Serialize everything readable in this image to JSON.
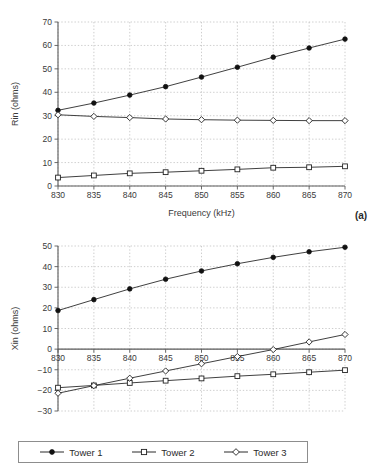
{
  "figure": {
    "background": "#ffffff",
    "line_color": "#2a2a2a",
    "grid_color": "#b9b9b9",
    "axis_color": "#5a5a5a"
  },
  "legend": {
    "position": "bottom",
    "border_color": "#8d8d8d",
    "entries": [
      {
        "label": "Tower 1",
        "marker": "filled-circle",
        "marker_icon": "filled-circle-icon"
      },
      {
        "label": "Tower 2",
        "marker": "open-square",
        "marker_icon": "open-square-icon"
      },
      {
        "label": "Tower 3",
        "marker": "open-diamond",
        "marker_icon": "open-diamond-icon"
      }
    ]
  },
  "chart_data": [
    {
      "id": "panel-a",
      "type": "line",
      "panel_label": "(a)",
      "title": "",
      "xlabel": "Frequency (kHz)",
      "ylabel": "Rin (ohms)",
      "x": [
        830,
        835,
        840,
        845,
        850,
        855,
        860,
        865,
        870
      ],
      "xlim": [
        830,
        870
      ],
      "ylim": [
        0,
        70
      ],
      "xticks": [
        830,
        835,
        840,
        845,
        850,
        855,
        860,
        865,
        870
      ],
      "yticks": [
        0,
        10,
        20,
        30,
        40,
        50,
        60,
        70
      ],
      "xtick_labels": [
        "830",
        "835",
        "840",
        "845",
        "850",
        "855",
        "860",
        "865",
        "870"
      ],
      "ytick_labels": [
        "0",
        "10",
        "20",
        "30",
        "40",
        "50",
        "60",
        "70"
      ],
      "grid": true,
      "legend_position": "external-bottom",
      "series": [
        {
          "name": "Tower 1",
          "marker": "filled-circle",
          "values": [
            32.3,
            35.4,
            38.8,
            42.4,
            46.5,
            50.7,
            55.0,
            58.9,
            62.7
          ]
        },
        {
          "name": "Tower 2",
          "marker": "open-square",
          "values": [
            3.6,
            4.5,
            5.4,
            5.9,
            6.5,
            7.1,
            7.8,
            8.0,
            8.4
          ]
        },
        {
          "name": "Tower 3",
          "marker": "open-diamond",
          "values": [
            30.4,
            29.7,
            29.2,
            28.6,
            28.3,
            28.1,
            28.0,
            27.9,
            27.9
          ]
        }
      ]
    },
    {
      "id": "panel-b",
      "type": "line",
      "panel_label": "(b)",
      "title": "",
      "xlabel": "Frequency (kHz)",
      "ylabel": "Xin (ohms)",
      "x": [
        830,
        835,
        840,
        845,
        850,
        855,
        860,
        865,
        870
      ],
      "xlim": [
        830,
        870
      ],
      "ylim": [
        -30,
        50
      ],
      "xticks": [
        830,
        835,
        840,
        845,
        850,
        855,
        860,
        865,
        870
      ],
      "yticks": [
        -30,
        -20,
        -10,
        0,
        10,
        20,
        30,
        40,
        50
      ],
      "xtick_labels": [
        "830",
        "835",
        "840",
        "845",
        "850",
        "855",
        "860",
        "865",
        "870"
      ],
      "ytick_labels": [
        "−30",
        "−20",
        "−10",
        "0",
        "10",
        "20",
        "30",
        "40",
        "50"
      ],
      "grid": true,
      "xaxis_at_zero": true,
      "legend_position": "external-bottom",
      "series": [
        {
          "name": "Tower 1",
          "marker": "filled-circle",
          "values": [
            18.7,
            24.0,
            29.2,
            33.9,
            37.9,
            41.4,
            44.5,
            47.2,
            49.4
          ]
        },
        {
          "name": "Tower 2",
          "marker": "open-square",
          "values": [
            -18.7,
            -17.6,
            -16.4,
            -15.3,
            -14.2,
            -13.1,
            -12.2,
            -11.2,
            -10.2
          ]
        },
        {
          "name": "Tower 3",
          "marker": "open-diamond",
          "values": [
            -21.4,
            -17.7,
            -14.1,
            -10.6,
            -7.1,
            -3.6,
            -0.2,
            3.5,
            7.1
          ]
        }
      ]
    }
  ]
}
